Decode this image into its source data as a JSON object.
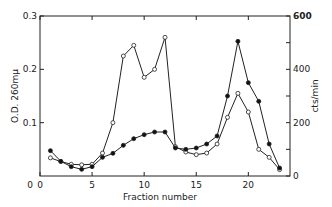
{
  "chart_data": {
    "type": "line",
    "title": "",
    "xlabel": "Fraction number",
    "ylabel": "O.D. 260mμ",
    "ylabel_right": "cts/min",
    "xlim": [
      0,
      24
    ],
    "ylim": [
      0,
      0.3
    ],
    "ylim_right": [
      0,
      600
    ],
    "x_ticks": [
      "0",
      "5",
      "10",
      "15",
      "20"
    ],
    "y_ticks": [
      "0.1",
      "0.2",
      "0.3"
    ],
    "y_ticks_right": [
      "0",
      "200",
      "400",
      "600"
    ],
    "x": [
      1,
      2,
      3,
      4,
      5,
      6,
      7,
      8,
      9,
      10,
      11,
      12,
      13,
      14,
      15,
      16,
      17,
      18,
      19,
      20,
      21,
      22,
      23
    ],
    "series": [
      {
        "name": "O.D. 260mμ (open circles)",
        "axis": "left",
        "marker": "open-circle",
        "values": [
          0.034,
          0.027,
          0.022,
          0.021,
          0.022,
          0.043,
          0.1,
          0.225,
          0.245,
          0.185,
          0.2,
          0.26,
          0.055,
          0.045,
          0.04,
          0.043,
          0.06,
          0.11,
          0.155,
          0.12,
          0.05,
          0.035,
          0.012
        ]
      },
      {
        "name": "cts/min (filled circles)",
        "axis": "right",
        "marker": "filled-circle",
        "values": [
          95,
          55,
          35,
          25,
          35,
          70,
          85,
          115,
          140,
          155,
          165,
          165,
          105,
          100,
          105,
          120,
          150,
          300,
          505,
          350,
          280,
          120,
          30
        ]
      }
    ],
    "grid": false,
    "legend": "none"
  }
}
